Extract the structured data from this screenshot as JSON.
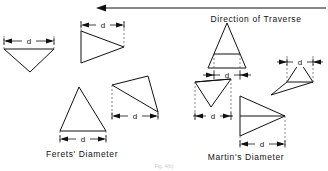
{
  "figure": {
    "traverse_label": "Direction of Traverse",
    "left_section_label": "Ferets' Diameter",
    "right_section_label": "Martin's Diameter",
    "caption": "Fig. 4(b)",
    "dimension_symbol": "d",
    "stroke_color": "#111111",
    "extension_color": "#555555",
    "background_color": "#ffffff"
  },
  "dimensions": {
    "d1": "d",
    "d2": "d",
    "d3": "d",
    "d4": "d",
    "d5": "d",
    "d6": "d",
    "d7": "d",
    "d8": "d"
  },
  "particles": {
    "feret_top_left": "downward-pointing-triangle",
    "feret_top_mid": "right-pointing-triangle",
    "feret_bottom_left": "upward-pointing-triangle",
    "feret_bottom_mid": "tilted-triangle",
    "martin_top_mid": "upward-triangle-with-bisecting-chord",
    "martin_top_right": "tilted-triangle-with-chord",
    "martin_bottom_left": "inverted-triangle-with-chord",
    "martin_bottom_mid": "right-triangle-with-horizontal-chord"
  }
}
